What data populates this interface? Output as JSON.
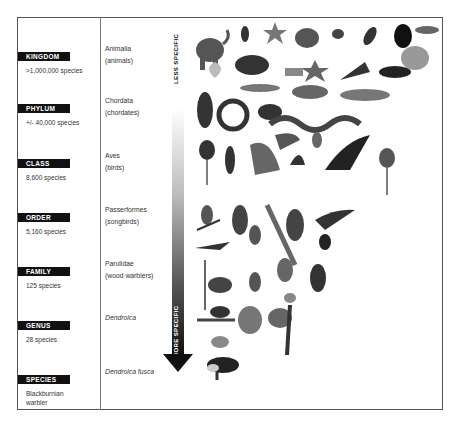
{
  "axis": {
    "top_label": "LESS SPECIFIC",
    "bottom_label": "MORE SPECIFIC"
  },
  "ranks": [
    {
      "label": "KINGDOM",
      "count": ">1,000,000 species",
      "taxon": "Animalia",
      "common": "(animals)",
      "italic": false
    },
    {
      "label": "PHYLUM",
      "count": "+/- 40,000 species",
      "taxon": "Chordata",
      "common": "(chordates)",
      "italic": false
    },
    {
      "label": "CLASS",
      "count": "8,600 species",
      "taxon": "Aves",
      "common": "(birds)",
      "italic": false
    },
    {
      "label": "ORDER",
      "count": "5,160 species",
      "taxon": "Passerformes",
      "common": "(songbirds)",
      "italic": false
    },
    {
      "label": "FAMILY",
      "count": "125 species",
      "taxon": "Parulidae",
      "common": "(wood warblers)",
      "italic": false
    },
    {
      "label": "GENUS",
      "count": "28 species",
      "taxon": "Dendroica",
      "common": "",
      "italic": true
    },
    {
      "label": "SPECIES",
      "count": "Blackburnian warbler",
      "taxon": "Dendroica fusca",
      "common": "",
      "italic": true
    }
  ],
  "illustrations": {
    "kingdom": [
      "elephant",
      "beetle",
      "starfish",
      "monkey",
      "tick",
      "insect",
      "water-bug",
      "caterpillar",
      "moth",
      "lemur",
      "starfish",
      "butterfly",
      "skunk",
      "shell"
    ],
    "phylum": [
      "penguin",
      "snake",
      "fish",
      "frog",
      "fish",
      "mouse",
      "snake"
    ],
    "class": [
      "heron",
      "bird",
      "hawk",
      "bird",
      "owl",
      "eagle",
      "ostrich"
    ],
    "order": [
      "songbird",
      "songbird",
      "songbird",
      "songbird",
      "kingfisher",
      "songbird"
    ],
    "family": [
      "warbler",
      "warbler",
      "warbler",
      "warbler",
      "warbler"
    ],
    "genus": [
      "warbler",
      "warbler",
      "warbler",
      "warbler"
    ],
    "species": [
      "blackburnian-warbler"
    ]
  }
}
